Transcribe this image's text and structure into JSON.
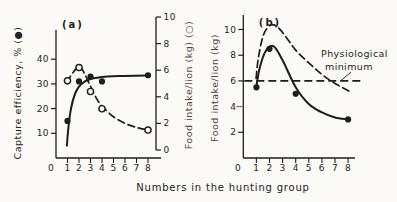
{
  "figure": {
    "background": "#fbfaf6",
    "ink": "#1f1d1b",
    "tick_label_color": "#262422",
    "warm_label_color": "#5a443c",
    "red_accent": "#cc5a50",
    "xlabel": "Numbers in the hunting group"
  },
  "chart_data": [
    {
      "type": "line",
      "panel": "a",
      "panel_label": "(a)",
      "x_ticks": [
        0,
        1,
        2,
        3,
        4,
        5,
        6,
        7,
        8
      ],
      "xlim": [
        0,
        8.6
      ],
      "left_axis": {
        "label": "Capture efficiency, % (●)",
        "ticks": [
          10,
          20,
          30,
          40
        ],
        "lim": [
          0,
          52
        ]
      },
      "right_axis": {
        "label": "Food intake/lion (kg) (○)",
        "ticks": [
          0,
          2,
          4,
          6,
          8,
          10
        ],
        "lim": [
          0,
          10
        ],
        "label_color": "#5a443c"
      },
      "series": [
        {
          "name": "capture-efficiency",
          "axis": "left",
          "marker": "filled",
          "line": "solid",
          "points": [
            [
              1,
              15
            ],
            [
              2,
              31
            ],
            [
              3,
              33
            ],
            [
              4,
              31
            ],
            [
              8,
              33.5
            ]
          ],
          "curve": [
            [
              0.95,
              5
            ],
            [
              1.05,
              11
            ],
            [
              1.3,
              20
            ],
            [
              1.7,
              26.5
            ],
            [
              2.2,
              30
            ],
            [
              3,
              32
            ],
            [
              4.5,
              33
            ],
            [
              6,
              33.2
            ],
            [
              8,
              33.4
            ]
          ]
        },
        {
          "name": "food-intake-per-lion",
          "axis": "right",
          "marker": "open",
          "line": "dashed",
          "points": [
            [
              1,
              5.2
            ],
            [
              2,
              6.2
            ],
            [
              3,
              4.4
            ],
            [
              4,
              3.1
            ],
            [
              8,
              1.5
            ]
          ],
          "curve": [
            [
              0.95,
              5.1
            ],
            [
              1.5,
              5.85
            ],
            [
              2.05,
              6.3
            ],
            [
              2.5,
              5.7
            ],
            [
              3,
              4.8
            ],
            [
              3.5,
              3.9
            ],
            [
              4,
              3.3
            ],
            [
              5,
              2.5
            ],
            [
              6,
              2.0
            ],
            [
              7,
              1.7
            ],
            [
              8,
              1.5
            ]
          ]
        }
      ]
    },
    {
      "type": "line",
      "panel": "b",
      "panel_label": "(b)",
      "x_ticks": [
        0,
        1,
        2,
        3,
        4,
        5,
        6,
        7,
        8
      ],
      "xlim": [
        0,
        8.6
      ],
      "left_axis": {
        "label": "Food intake/lion (kg)",
        "ticks": [
          2,
          4,
          6,
          8,
          10
        ],
        "lim": [
          0,
          11.2
        ],
        "red_tick": 4,
        "label_color": "#50413c"
      },
      "series": [
        {
          "name": "observed-food-intake",
          "axis": "left",
          "marker": "filled",
          "line": "solid",
          "points": [
            [
              1,
              5.5
            ],
            [
              2,
              8.5
            ],
            [
              4,
              5.0
            ],
            [
              8,
              3.0
            ]
          ],
          "curve": [
            [
              0.97,
              5.4
            ],
            [
              1.25,
              7.0
            ],
            [
              1.7,
              8.3
            ],
            [
              2.3,
              8.7
            ],
            [
              3,
              7.6
            ],
            [
              4,
              5.5
            ],
            [
              5,
              4.2
            ],
            [
              6,
              3.55
            ],
            [
              7,
              3.15
            ],
            [
              8,
              3.0
            ]
          ]
        },
        {
          "name": "potential-food-intake",
          "axis": "left",
          "marker": "none",
          "line": "dashed",
          "curve": [
            [
              0.98,
              6.2
            ],
            [
              1.15,
              7.8
            ],
            [
              1.55,
              9.6
            ],
            [
              2.1,
              10.35
            ],
            [
              2.6,
              10.2
            ],
            [
              3.2,
              9.5
            ],
            [
              4,
              8.4
            ],
            [
              5,
              7.4
            ],
            [
              6,
              6.5
            ],
            [
              7,
              5.8
            ],
            [
              8.3,
              5.1
            ]
          ]
        }
      ],
      "reference_line": {
        "value": 6,
        "style": "dashed",
        "label_line1": "Physiological",
        "label_line2": "minimum"
      }
    }
  ]
}
